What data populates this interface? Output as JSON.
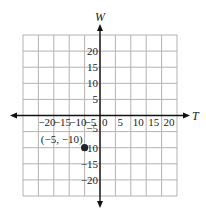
{
  "chart_data": {
    "type": "scatter",
    "title": "",
    "xlabel": "T",
    "ylabel": "W",
    "xlim": [
      -25,
      25
    ],
    "ylim": [
      -25,
      25
    ],
    "grid": true,
    "grid_step": 5,
    "x_ticks": [
      -20,
      -15,
      -10,
      -5,
      0,
      5,
      10,
      15,
      20
    ],
    "y_ticks": [
      20,
      15,
      10,
      5,
      -5,
      -10,
      -15,
      -20
    ],
    "x_tick_labels": [
      "−20",
      "−15",
      "−10",
      "−5",
      "0",
      "5",
      "10",
      "15",
      "20"
    ],
    "y_tick_labels": [
      "20",
      "15",
      "10",
      "5",
      "−5",
      "−10",
      "−15",
      "−20"
    ],
    "points": [
      {
        "x": -5,
        "y": -10,
        "label": "(−5, −10)"
      }
    ],
    "colors": {
      "grid": "#b3b3b3",
      "axis": "#111111",
      "point": "#222222"
    }
  }
}
